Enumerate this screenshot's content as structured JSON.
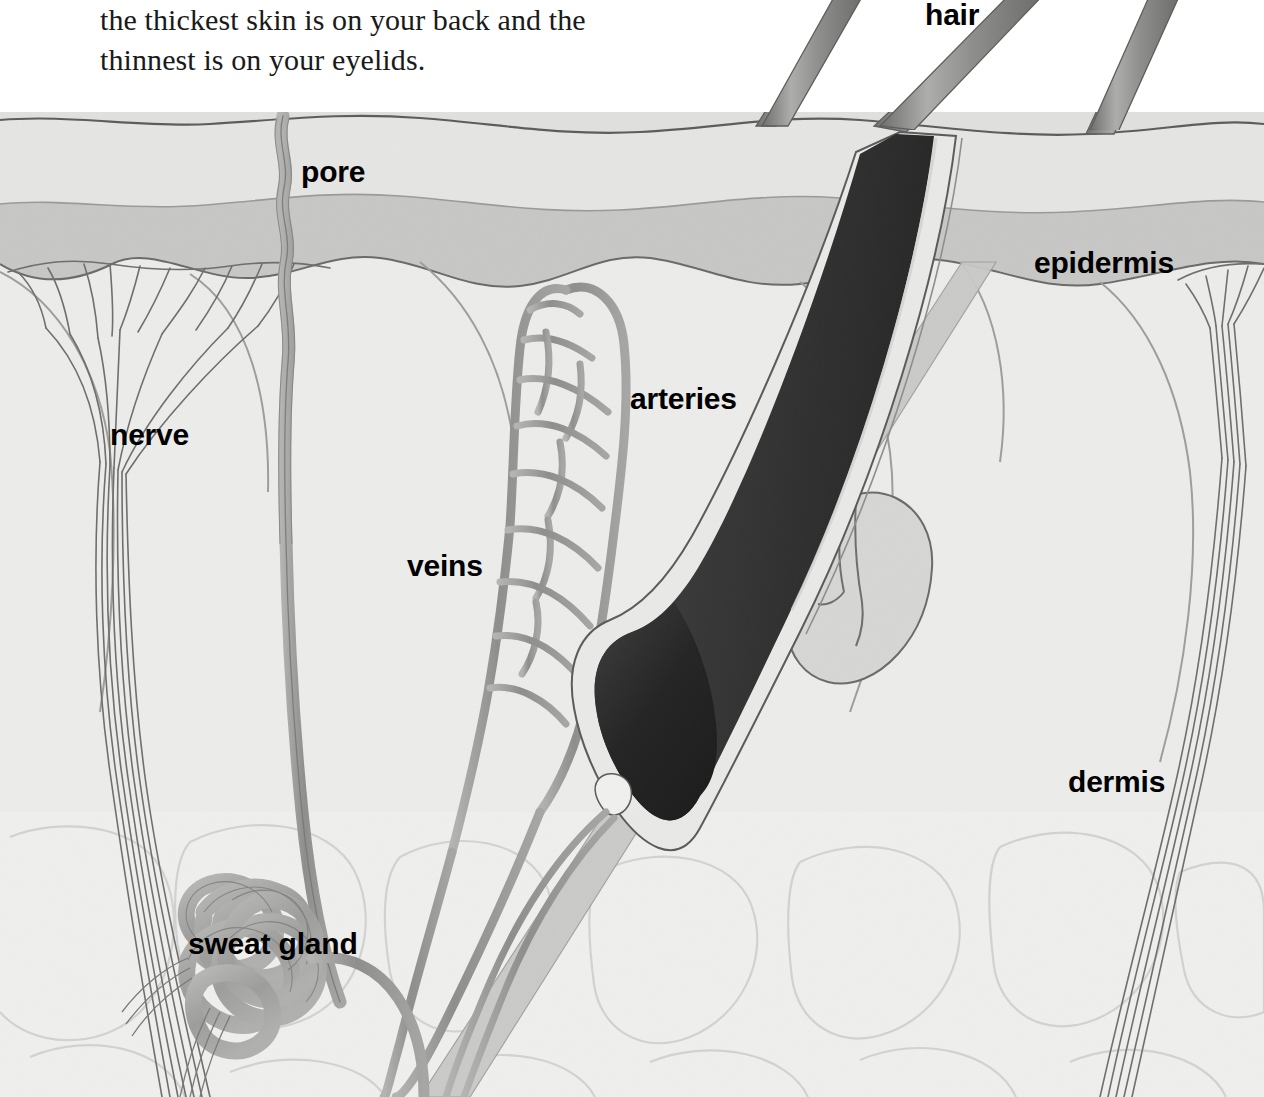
{
  "caption": {
    "line1": "the thickest skin is on your back and the",
    "line2": "thinnest is on your eyelids."
  },
  "labels": {
    "hair": "hair",
    "pore": "pore",
    "epidermis": "epidermis",
    "nerve": "nerve",
    "arteries": "arteries",
    "veins": "veins",
    "dermis": "dermis",
    "sweat_gland": "sweat gland"
  },
  "colors": {
    "page_background": "#ffffff",
    "text": "#1a1a1a",
    "label_text": "#000000",
    "epidermis_upper": "#e3e3e1",
    "epidermis_lower": "#c9c9c7",
    "dermis": "#ececea",
    "hypodermis": "#eeeeec",
    "vessel_gray": "#9a9a98",
    "hair_shaft_gray": "#8e8e8c",
    "follicle_dark": "#2e2e2e",
    "outline": "#4a4a4a",
    "fat_cell_outline": "#cfcfcd"
  },
  "diagram": {
    "type": "anatomical-cross-section",
    "layers": [
      {
        "name": "epidermis",
        "description": "top banded layer, two tones"
      },
      {
        "name": "dermis",
        "description": "large middle layer containing follicle, glands, vessels, nerves"
      },
      {
        "name": "hypodermis",
        "description": "lower fat-cell layer with faint lobular outlines"
      }
    ],
    "structures": [
      {
        "name": "hair-shafts",
        "count": 3,
        "description": "gray strands emerging above skin surface"
      },
      {
        "name": "hair-follicle",
        "description": "dark angled follicle with bulb at base"
      },
      {
        "name": "sebaceous-gland",
        "description": "lobed gray blob attached to follicle"
      },
      {
        "name": "capillary-loop",
        "description": "elongated vessel loop with ladder cross-links"
      },
      {
        "name": "sweat-gland",
        "description": "coiled tangled tube in lower dermis"
      },
      {
        "name": "sweat-duct-pore",
        "description": "wavy tube rising to surface pore"
      },
      {
        "name": "nerve-left",
        "description": "nerve bundle branching like a tree at epidermis"
      },
      {
        "name": "nerve-right",
        "description": "nerve bundle branching at right epidermis"
      }
    ]
  }
}
